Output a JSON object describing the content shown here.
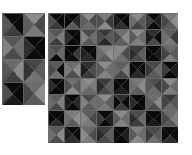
{
  "figure": {
    "background_color": "#ffffff",
    "type": "triangle-tiling-grayscale-pair",
    "gridline_color": "#6e6e6e",
    "gridline_width": 0.35,
    "palette": {
      "black": "#050505",
      "near_black": "#121212",
      "very_dark": "#1e1e1e",
      "dark": "#2c2c2c",
      "dark_mid": "#3a3a3a",
      "mid": "#4a4a4a",
      "mid_light": "#5c5c5c",
      "light": "#6e6e6e",
      "lighter": "#808080",
      "lightest": "#949494"
    }
  },
  "panels": [
    {
      "id": "panel-small",
      "name": "left-tiling-panel",
      "x": 2,
      "y": 13,
      "width": 43,
      "height": 92,
      "cols": 2,
      "rows": 4,
      "cell_w": 21.5,
      "cell_h": 23.0,
      "cells": [
        {
          "r": 0,
          "c": 0,
          "top": "#0a0a0a",
          "right": "#0a0a0a",
          "bottom": "#3d3d3d",
          "left": "#565656"
        },
        {
          "r": 0,
          "c": 1,
          "top": "#8c8c8c",
          "right": "#4a4a4a",
          "bottom": "#7a7a7a",
          "left": "#5e5e5e"
        },
        {
          "r": 1,
          "c": 0,
          "top": "#585858",
          "right": "#6e6e6e",
          "bottom": "#4c4c4c",
          "left": "#828282"
        },
        {
          "r": 1,
          "c": 1,
          "top": "#0a0a0a",
          "right": "#0a0a0a",
          "bottom": "#0a0a0a",
          "left": "#2f2f2f"
        },
        {
          "r": 2,
          "c": 0,
          "top": "#6a6a6a",
          "right": "#8a8a8a",
          "bottom": "#404040",
          "left": "#555555"
        },
        {
          "r": 2,
          "c": 1,
          "top": "#464646",
          "right": "#5c5c5c",
          "bottom": "#737373",
          "left": "#333333"
        },
        {
          "r": 3,
          "c": 0,
          "top": "#0a0a0a",
          "right": "#0a0a0a",
          "bottom": "#1a1a1a",
          "left": "#4f4f4f"
        },
        {
          "r": 3,
          "c": 1,
          "top": "#6c6c6c",
          "right": "#8e8e8e",
          "bottom": "#5a5a5a",
          "left": "#474747"
        }
      ]
    },
    {
      "id": "panel-large",
      "name": "right-tiling-panel",
      "x": 48,
      "y": 13,
      "width": 130,
      "height": 130,
      "cols": 8,
      "rows": 8,
      "cell_w": 16.25,
      "cell_h": 16.25,
      "cells": [
        {
          "r": 0,
          "c": 0,
          "top": "#0a0a0a",
          "right": "#0a0a0a",
          "bottom": "#3a3a3a",
          "left": "#4e4e4e"
        },
        {
          "r": 0,
          "c": 1,
          "top": "#0a0a0a",
          "right": "#2a2a2a",
          "bottom": "#5a5a5a",
          "left": "#0a0a0a"
        },
        {
          "r": 0,
          "c": 2,
          "top": "#8e8e8e",
          "right": "#4a4a4a",
          "bottom": "#6a6a6a",
          "left": "#5e5e5e"
        },
        {
          "r": 0,
          "c": 3,
          "top": "#7c7c7c",
          "right": "#3a3a3a",
          "bottom": "#8a8a8a",
          "left": "#505050"
        },
        {
          "r": 0,
          "c": 4,
          "top": "#0a0a0a",
          "right": "#0a0a0a",
          "bottom": "#2e2e2e",
          "left": "#1a1a1a"
        },
        {
          "r": 0,
          "c": 5,
          "top": "#8a8a8a",
          "right": "#5c5c5c",
          "bottom": "#444444",
          "left": "#6e6e6e"
        },
        {
          "r": 0,
          "c": 6,
          "top": "#0a0a0a",
          "right": "#1e1e1e",
          "bottom": "#0a0a0a",
          "left": "#3c3c3c"
        },
        {
          "r": 0,
          "c": 7,
          "top": "#7a7a7a",
          "right": "#8e8e8e",
          "bottom": "#5a5a5a",
          "left": "#464646"
        },
        {
          "r": 1,
          "c": 0,
          "top": "#565656",
          "right": "#7e7e7e",
          "bottom": "#3c3c3c",
          "left": "#6a6a6a"
        },
        {
          "r": 1,
          "c": 1,
          "top": "#0a0a0a",
          "right": "#0a0a0a",
          "bottom": "#0a0a0a",
          "left": "#2c2c2c"
        },
        {
          "r": 1,
          "c": 2,
          "top": "#4a4a4a",
          "right": "#6e6e6e",
          "bottom": "#585858",
          "left": "#828282"
        },
        {
          "r": 1,
          "c": 3,
          "top": "#383838",
          "right": "#5a5a5a",
          "bottom": "#2a2a2a",
          "left": "#4c4c4c"
        },
        {
          "r": 1,
          "c": 4,
          "top": "#6e6e6e",
          "right": "#8c8c8c",
          "bottom": "#5e5e5e",
          "left": "#484848"
        },
        {
          "r": 1,
          "c": 5,
          "top": "#8a8a8a",
          "right": "#6c6c6c",
          "bottom": "#7e7e7e",
          "left": "#5a5a5a"
        },
        {
          "r": 1,
          "c": 6,
          "top": "#2e2e2e",
          "right": "#0a0a0a",
          "bottom": "#4a4a4a",
          "left": "#1c1c1c"
        },
        {
          "r": 1,
          "c": 7,
          "top": "#5c5c5c",
          "right": "#3a3a3a",
          "bottom": "#7a7a7a",
          "left": "#6e6e6e"
        },
        {
          "r": 2,
          "c": 0,
          "top": "#4e4e4e",
          "right": "#6a6a6a",
          "bottom": "#0a0a0a",
          "left": "#5c5c5c"
        },
        {
          "r": 2,
          "c": 1,
          "top": "#0a0a0a",
          "right": "#3a3a3a",
          "bottom": "#0a0a0a",
          "left": "#0a0a0a"
        },
        {
          "r": 2,
          "c": 2,
          "top": "#0a0a0a",
          "right": "#0a0a0a",
          "bottom": "#2a2a2a",
          "left": "#1e1e1e"
        },
        {
          "r": 2,
          "c": 3,
          "top": "#7e7e7e",
          "right": "#8e8e8e",
          "bottom": "#5a5a5a",
          "left": "#6c6c6c"
        },
        {
          "r": 2,
          "c": 4,
          "top": "#8a8a8a",
          "right": "#4a4a4a",
          "bottom": "#6e6e6e",
          "left": "#888888"
        },
        {
          "r": 2,
          "c": 5,
          "top": "#3c3c3c",
          "right": "#5e5e5e",
          "bottom": "#484848",
          "left": "#2c2c2c"
        },
        {
          "r": 2,
          "c": 6,
          "top": "#0a0a0a",
          "right": "#1a1a1a",
          "bottom": "#0a0a0a",
          "left": "#0a0a0a"
        },
        {
          "r": 2,
          "c": 7,
          "top": "#6a6a6a",
          "right": "#5a5a5a",
          "bottom": "#7c7c7c",
          "left": "#444444"
        },
        {
          "r": 3,
          "c": 0,
          "top": "#5a5a5a",
          "right": "#0a0a0a",
          "bottom": "#6e6e6e",
          "left": "#4a4a4a"
        },
        {
          "r": 3,
          "c": 1,
          "top": "#6c6c6c",
          "right": "#8a8a8a",
          "bottom": "#4e4e4e",
          "left": "#7a7a7a"
        },
        {
          "r": 3,
          "c": 2,
          "top": "#2e2e2e",
          "right": "#4c4c4c",
          "bottom": "#3a3a3a",
          "left": "#1e1e1e"
        },
        {
          "r": 3,
          "c": 3,
          "top": "#8c8c8c",
          "right": "#6e6e6e",
          "bottom": "#828282",
          "left": "#5c5c5c"
        },
        {
          "r": 3,
          "c": 4,
          "top": "#5e5e5e",
          "right": "#7e7e7e",
          "bottom": "#484848",
          "left": "#6a6a6a"
        },
        {
          "r": 3,
          "c": 5,
          "top": "#0a0a0a",
          "right": "#0a0a0a",
          "bottom": "#2a2a2a",
          "left": "#0a0a0a"
        },
        {
          "r": 3,
          "c": 6,
          "top": "#4a4a4a",
          "right": "#6c6c6c",
          "bottom": "#5a5a5a",
          "left": "#383838"
        },
        {
          "r": 3,
          "c": 7,
          "top": "#0a0a0a",
          "right": "#1c1c1c",
          "bottom": "#0a0a0a",
          "left": "#3e3e3e"
        },
        {
          "r": 4,
          "c": 0,
          "top": "#0a0a0a",
          "right": "#0a0a0a",
          "bottom": "#0a0a0a",
          "left": "#2c2c2c"
        },
        {
          "r": 4,
          "c": 1,
          "top": "#6e6e6e",
          "right": "#5a5a5a",
          "bottom": "#8a8a8a",
          "left": "#4c4c4c"
        },
        {
          "r": 4,
          "c": 2,
          "top": "#8e8e8e",
          "right": "#7c7c7c",
          "bottom": "#6a6a6a",
          "left": "#848484"
        },
        {
          "r": 4,
          "c": 3,
          "top": "#3a3a3a",
          "right": "#5e5e5e",
          "bottom": "#4a4a4a",
          "left": "#2a2a2a"
        },
        {
          "r": 4,
          "c": 4,
          "top": "#0a0a0a",
          "right": "#0a0a0a",
          "bottom": "#1e1e1e",
          "left": "#0a0a0a"
        },
        {
          "r": 4,
          "c": 5,
          "top": "#7a7a7a",
          "right": "#8c8c8c",
          "bottom": "#5c5c5c",
          "left": "#6e6e6e"
        },
        {
          "r": 4,
          "c": 6,
          "top": "#4e4e4e",
          "right": "#3c3c3c",
          "bottom": "#6c6c6c",
          "left": "#585858"
        },
        {
          "r": 4,
          "c": 7,
          "top": "#8a8a8a",
          "right": "#6a6a6a",
          "bottom": "#7e7e7e",
          "left": "#4a4a4a"
        },
        {
          "r": 5,
          "c": 0,
          "top": "#5c5c5c",
          "right": "#7e7e7e",
          "bottom": "#464646",
          "left": "#6a6a6a"
        },
        {
          "r": 5,
          "c": 1,
          "top": "#0a0a0a",
          "right": "#2a2a2a",
          "bottom": "#0a0a0a",
          "left": "#1a1a1a"
        },
        {
          "r": 5,
          "c": 2,
          "top": "#4a4a4a",
          "right": "#6e6e6e",
          "bottom": "#5a5a5a",
          "left": "#828282"
        },
        {
          "r": 5,
          "c": 3,
          "top": "#8c8c8c",
          "right": "#5e5e5e",
          "bottom": "#7a7a7a",
          "left": "#6c6c6c"
        },
        {
          "r": 5,
          "c": 4,
          "top": "#2e2e2e",
          "right": "#0a0a0a",
          "bottom": "#3c3c3c",
          "left": "#0a0a0a"
        },
        {
          "r": 5,
          "c": 5,
          "top": "#0a0a0a",
          "right": "#0a0a0a",
          "bottom": "#0a0a0a",
          "left": "#2c2c2c"
        },
        {
          "r": 5,
          "c": 6,
          "top": "#6e6e6e",
          "right": "#8a8a8a",
          "bottom": "#4c4c4c",
          "left": "#5e5e5e"
        },
        {
          "r": 5,
          "c": 7,
          "top": "#3a3a3a",
          "right": "#585858",
          "bottom": "#6a6a6a",
          "left": "#444444"
        },
        {
          "r": 6,
          "c": 0,
          "top": "#0a0a0a",
          "right": "#0a0a0a",
          "bottom": "#2a2a2a",
          "left": "#0a0a0a"
        },
        {
          "r": 6,
          "c": 1,
          "top": "#7c7c7c",
          "right": "#8e8e8e",
          "bottom": "#5a5a5a",
          "left": "#6c6c6c"
        },
        {
          "r": 6,
          "c": 2,
          "top": "#5e5e5e",
          "right": "#4a4a4a",
          "bottom": "#7a7a7a",
          "left": "#868686"
        },
        {
          "r": 6,
          "c": 3,
          "top": "#0a0a0a",
          "right": "#1e1e1e",
          "bottom": "#0a0a0a",
          "left": "#3a3a3a"
        },
        {
          "r": 6,
          "c": 4,
          "top": "#8a8a8a",
          "right": "#6e6e6e",
          "bottom": "#828282",
          "left": "#5c5c5c"
        },
        {
          "r": 6,
          "c": 5,
          "top": "#4c4c4c",
          "right": "#6a6a6a",
          "bottom": "#3e3e3e",
          "left": "#2c2c2c"
        },
        {
          "r": 6,
          "c": 6,
          "top": "#0a0a0a",
          "right": "#0a0a0a",
          "bottom": "#1a1a1a",
          "left": "#0a0a0a"
        },
        {
          "r": 6,
          "c": 7,
          "top": "#6c6c6c",
          "right": "#7e7e7e",
          "bottom": "#585858",
          "left": "#4a4a4a"
        },
        {
          "r": 7,
          "c": 0,
          "top": "#5a5a5a",
          "right": "#8a8a8a",
          "bottom": "#4e4e4e",
          "left": "#6e6e6e"
        },
        {
          "r": 7,
          "c": 1,
          "top": "#0a0a0a",
          "right": "#0a0a0a",
          "bottom": "#2e2e2e",
          "left": "#1c1c1c"
        },
        {
          "r": 7,
          "c": 2,
          "top": "#6a6a6a",
          "right": "#4c4c4c",
          "bottom": "#7c7c7c",
          "left": "#8c8c8c"
        },
        {
          "r": 7,
          "c": 3,
          "top": "#3c3c3c",
          "right": "#5e5e5e",
          "bottom": "#484848",
          "left": "#2a2a2a"
        },
        {
          "r": 7,
          "c": 4,
          "top": "#0a0a0a",
          "right": "#1e1e1e",
          "bottom": "#0a0a0a",
          "left": "#0a0a0a"
        },
        {
          "r": 7,
          "c": 5,
          "top": "#7e7e7e",
          "right": "#6c6c6c",
          "bottom": "#8a8a8a",
          "left": "#5a5a5a"
        },
        {
          "r": 7,
          "c": 6,
          "top": "#4a4a4a",
          "right": "#585858",
          "bottom": "#6e6e6e",
          "left": "#383838"
        },
        {
          "r": 7,
          "c": 7,
          "top": "#0a0a0a",
          "right": "#0a0a0a",
          "bottom": "#2c2c2c",
          "left": "#0a0a0a"
        }
      ]
    }
  ]
}
